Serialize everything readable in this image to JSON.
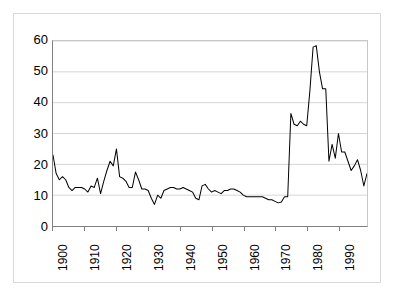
{
  "chart_data": {
    "type": "line",
    "title": "",
    "subtitle": "",
    "xlabel": "",
    "ylabel": "",
    "xlim": [
      1900,
      1999
    ],
    "ylim": [
      0,
      60
    ],
    "grid": true,
    "grid_axis": "y",
    "legend": false,
    "legend_position": "none",
    "line_color": "#000000",
    "y_ticks": [
      0,
      10,
      20,
      30,
      40,
      50,
      60
    ],
    "y_tick_labels": [
      "0",
      "10",
      "20",
      "30",
      "40",
      "50",
      "60"
    ],
    "x_ticks": [
      1900,
      1910,
      1920,
      1930,
      1940,
      1950,
      1960,
      1970,
      1980,
      1990
    ],
    "x_tick_labels": [
      "1900",
      "1910",
      "1920",
      "1930",
      "1940",
      "1950",
      "1960",
      "1970",
      "1980",
      "1990"
    ],
    "series": [
      {
        "name": "series-1",
        "x": [
          1900,
          1901,
          1902,
          1903,
          1904,
          1905,
          1906,
          1907,
          1908,
          1909,
          1910,
          1911,
          1912,
          1913,
          1914,
          1915,
          1916,
          1917,
          1918,
          1919,
          1920,
          1921,
          1922,
          1923,
          1924,
          1925,
          1926,
          1927,
          1928,
          1929,
          1930,
          1931,
          1932,
          1933,
          1934,
          1935,
          1936,
          1937,
          1938,
          1939,
          1940,
          1941,
          1942,
          1943,
          1944,
          1945,
          1946,
          1947,
          1948,
          1949,
          1950,
          1951,
          1952,
          1953,
          1954,
          1955,
          1956,
          1957,
          1958,
          1959,
          1960,
          1961,
          1962,
          1963,
          1964,
          1965,
          1966,
          1967,
          1968,
          1969,
          1970,
          1971,
          1972,
          1973,
          1974,
          1975,
          1976,
          1977,
          1978,
          1979,
          1980,
          1981,
          1982,
          1983,
          1984,
          1985,
          1986,
          1987,
          1988,
          1989,
          1990,
          1991,
          1992,
          1993,
          1994,
          1995,
          1996,
          1997,
          1998,
          1999
        ],
        "values": [
          23.0,
          17.0,
          15.0,
          16.0,
          15.0,
          12.5,
          11.5,
          12.5,
          12.5,
          12.5,
          12.0,
          11.0,
          13.0,
          12.5,
          15.5,
          10.5,
          14.5,
          18.0,
          21.0,
          19.5,
          25.0,
          16.0,
          15.5,
          14.5,
          12.5,
          12.5,
          17.5,
          15.0,
          12.0,
          12.0,
          11.5,
          9.0,
          7.0,
          10.0,
          9.0,
          11.5,
          12.0,
          12.5,
          12.5,
          12.0,
          12.0,
          12.5,
          12.0,
          11.5,
          11.0,
          9.0,
          8.5,
          13.0,
          13.5,
          12.0,
          11.0,
          11.5,
          11.0,
          10.5,
          11.5,
          11.5,
          12.0,
          12.0,
          11.5,
          11.0,
          10.0,
          9.5,
          9.5,
          9.5,
          9.5,
          9.5,
          9.5,
          9.0,
          8.5,
          8.5,
          8.0,
          7.5,
          7.8,
          9.5,
          9.5,
          36.5,
          33.0,
          32.5,
          34.0,
          33.0,
          32.5,
          44.0,
          58.0,
          58.5,
          50.0,
          44.5,
          44.5,
          21.0,
          26.5,
          22.0,
          30.0,
          24.0,
          24.0,
          21.0,
          18.0,
          19.5,
          21.5,
          18.0,
          13.0,
          17.0
        ]
      }
    ]
  }
}
